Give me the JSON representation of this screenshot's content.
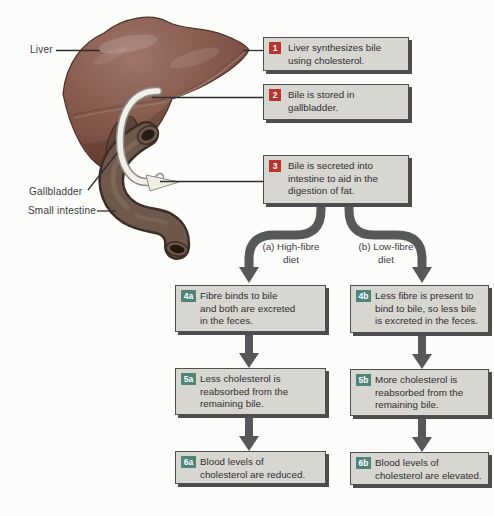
{
  "figure": {
    "title_hint": "Bile, fibre and cholesterol flow diagram",
    "anatomy": {
      "labels": [
        {
          "text": "Liver"
        },
        {
          "text": "Gallbladder"
        },
        {
          "text": "Small intestine"
        }
      ]
    },
    "steps": [
      {
        "badge": "1",
        "lines": [
          "Liver synthesizes bile",
          "using cholesterol."
        ]
      },
      {
        "badge": "2",
        "lines": [
          "Bile is stored in",
          "gallbladder."
        ]
      },
      {
        "badge": "3",
        "lines": [
          "Bile is secreted into",
          "intestine to aid in the",
          "digestion of fat."
        ]
      },
      {
        "badge": "4a",
        "lines": [
          "Fibre binds to bile",
          "and both are excreted",
          "in the feces."
        ]
      },
      {
        "badge": "4b",
        "lines": [
          "Less fibre is present to",
          "bind to bile, so less bile",
          "is excreted in the feces."
        ]
      },
      {
        "badge": "5a",
        "lines": [
          "Less cholesterol is",
          "reabsorbed from the",
          "remaining bile."
        ]
      },
      {
        "badge": "5b",
        "lines": [
          "More cholesterol is",
          "reabsorbed from the",
          "remaining bile."
        ]
      },
      {
        "badge": "6a",
        "lines": [
          "Blood levels of",
          "cholesterol are reduced."
        ]
      },
      {
        "badge": "6b",
        "lines": [
          "Blood levels of",
          "cholesterol are elevated."
        ]
      }
    ],
    "branch_labels": [
      {
        "lines": [
          "(a) High-fibre",
          "diet"
        ]
      },
      {
        "lines": [
          "(b) Low-fibre",
          "diet"
        ]
      }
    ],
    "colors": {
      "numbered_badge_red": "#b8342c",
      "lettered_badge_teal": "#4e8578",
      "box_fill": "#d8d6d1",
      "box_border": "#4f4f4f",
      "box_shadow": "#4d4d4d",
      "arrow_gray": "#57585a",
      "liver_brown": "#85594b",
      "bile_duct_ivory": "#f2efe6",
      "intestine_brown": "#6e584c"
    }
  }
}
